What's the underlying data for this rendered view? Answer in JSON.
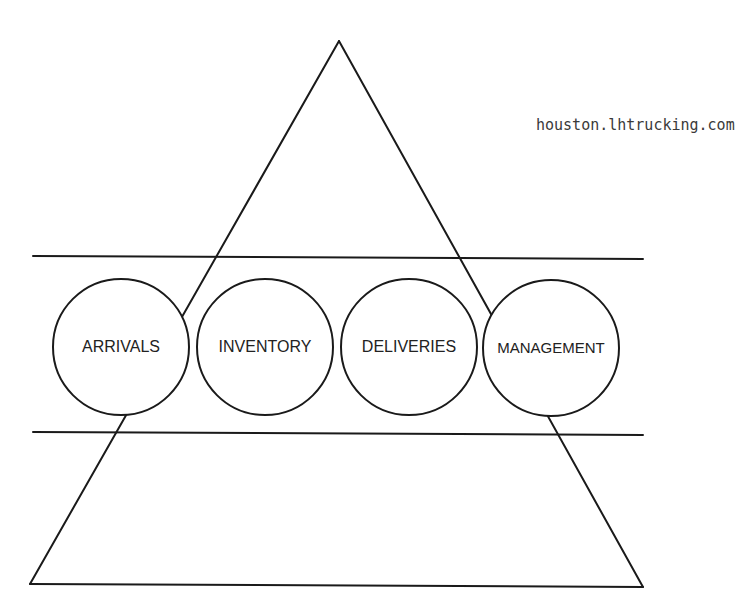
{
  "diagram": {
    "url_text": "houston.lhtrucking.com",
    "stroke_color": "#1a1a1a",
    "nodes": [
      {
        "id": "arrivals",
        "label": "ARRIVALS",
        "cx": 121,
        "cy": 347,
        "r": 68
      },
      {
        "id": "inventory",
        "label": "INVENTORY",
        "cx": 265,
        "cy": 347,
        "r": 68
      },
      {
        "id": "deliveries",
        "label": "DELIVERIES",
        "cx": 409,
        "cy": 347,
        "r": 68
      },
      {
        "id": "management",
        "label": "MANAGEMENT",
        "cx": 551,
        "cy": 348,
        "r": 68
      }
    ],
    "triangle": {
      "apex": [
        339,
        41
      ],
      "bottom_left": [
        30,
        584
      ],
      "bottom_right": [
        643,
        587
      ]
    },
    "bands": [
      {
        "y1": 256,
        "y2": 259,
        "x1": 33,
        "x2": 643
      },
      {
        "y1": 432,
        "y2": 435,
        "x1": 33,
        "x2": 643
      }
    ]
  }
}
